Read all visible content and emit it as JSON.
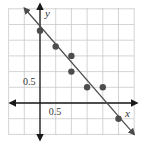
{
  "chart_data": {
    "type": "scatter",
    "title": "",
    "xlabel": "x",
    "ylabel": "y",
    "xlim": [
      -1.0,
      3.0
    ],
    "ylim": [
      -1.0,
      3.0
    ],
    "grid": true,
    "grid_step": 0.5,
    "x_tick_labels": [
      {
        "value": 0.5,
        "label": "0.5"
      }
    ],
    "y_tick_labels": [
      {
        "value": 0.5,
        "label": "0.5"
      }
    ],
    "points": [
      {
        "x": 0.0,
        "y": 2.3
      },
      {
        "x": 0.5,
        "y": 1.8
      },
      {
        "x": 1.0,
        "y": 1.5
      },
      {
        "x": 1.0,
        "y": 1.0
      },
      {
        "x": 1.5,
        "y": 0.5
      },
      {
        "x": 2.0,
        "y": 0.5
      },
      {
        "x": 2.5,
        "y": -0.5
      }
    ],
    "fit_line": {
      "slope": -1.15,
      "intercept": 2.45,
      "x_range": [
        -0.5,
        3.0
      ],
      "arrows": "both"
    },
    "colors": {
      "grid": "#c9c9c9",
      "axes": "#1a1a1a",
      "points": "#4d4d4d",
      "line": "#4a4a4a"
    }
  }
}
